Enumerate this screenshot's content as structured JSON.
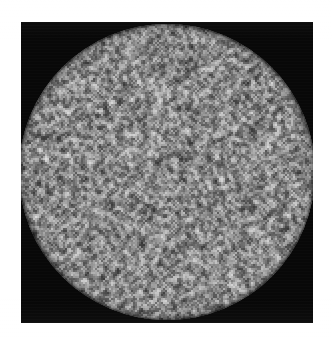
{
  "figure": {
    "kind": "speckle-noise-image",
    "canvas": {
      "width": 332,
      "height": 338,
      "background_color": "#ffffff"
    },
    "plate": {
      "label": "black square background plate",
      "x": 21,
      "y": 22,
      "width": 292,
      "height": 301,
      "color": "#080808"
    },
    "aperture": {
      "label": "circular noise aperture",
      "shape": "circle",
      "center_x": 167,
      "center_y": 172,
      "radius": 148,
      "clipped_edges": "left, right, bottom"
    },
    "noise": {
      "label": "random grayscale speckle",
      "block_size_px": 2,
      "distribution": "uniform-random grayscale",
      "min_gray": 8,
      "max_gray": 255,
      "mean_gray": 140,
      "contrast": "high",
      "seed": 20240617
    },
    "render_style": {
      "label": "low-quality photocopy / halftone scan reproduction",
      "softening": true
    }
  }
}
